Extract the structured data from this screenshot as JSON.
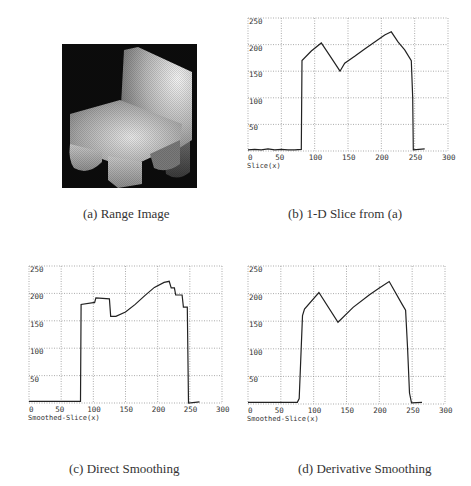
{
  "figure": {
    "panels": [
      {
        "id": "a",
        "caption": "(a) Range Image",
        "type": "image"
      },
      {
        "id": "b",
        "caption": "(b) 1-D Slice from (a)",
        "type": "plot",
        "xlabel": "Slice(x)"
      },
      {
        "id": "c",
        "caption": "(c) Direct Smoothing",
        "type": "plot",
        "xlabel": "Smoothed-Slice(x)"
      },
      {
        "id": "d",
        "caption": "(d) Derivative Smoothing",
        "type": "plot",
        "xlabel": "Smoothed-Slice(x)"
      }
    ]
  },
  "chart_data": [
    {
      "type": "line",
      "title": "(b) 1-D Slice from (a)",
      "xlabel": "Slice(x)",
      "ylabel": "",
      "xlim": [
        0,
        300
      ],
      "ylim": [
        0,
        250
      ],
      "xticks": [
        0,
        50,
        100,
        150,
        200,
        250,
        300
      ],
      "yticks": [
        50,
        100,
        150,
        200,
        250
      ],
      "grid": true,
      "series": [
        {
          "name": "slice",
          "x": [
            0,
            10,
            20,
            30,
            40,
            50,
            60,
            70,
            80,
            81,
            95,
            110,
            125,
            138,
            145,
            160,
            175,
            190,
            205,
            215,
            225,
            235,
            245,
            247,
            248,
            265
          ],
          "y": [
            2,
            3,
            2,
            4,
            2,
            3,
            2,
            2,
            3,
            170,
            188,
            203,
            175,
            150,
            165,
            178,
            192,
            205,
            218,
            224,
            205,
            190,
            170,
            100,
            2,
            4
          ]
        }
      ]
    },
    {
      "type": "line",
      "title": "(c) Direct Smoothing",
      "xlabel": "Smoothed-Slice(x)",
      "ylabel": "",
      "xlim": [
        0,
        300
      ],
      "ylim": [
        0,
        250
      ],
      "xticks": [
        0,
        50,
        100,
        150,
        200,
        250,
        300
      ],
      "yticks": [
        50,
        100,
        150,
        200,
        250
      ],
      "grid": true,
      "series": [
        {
          "name": "direct-smoothed",
          "x": [
            0,
            80,
            81,
            100,
            102,
            104,
            125,
            127,
            135,
            150,
            165,
            180,
            195,
            210,
            218,
            221,
            226,
            228,
            238,
            240,
            246,
            248,
            265
          ],
          "y": [
            3,
            3,
            180,
            183,
            183,
            192,
            190,
            158,
            158,
            166,
            180,
            196,
            211,
            220,
            222,
            210,
            210,
            197,
            197,
            175,
            175,
            0,
            2
          ]
        }
      ]
    },
    {
      "type": "line",
      "title": "(d) Derivative Smoothing",
      "xlabel": "Smoothed-Slice(x)",
      "ylabel": "",
      "xlim": [
        0,
        300
      ],
      "ylim": [
        0,
        250
      ],
      "xticks": [
        0,
        50,
        100,
        150,
        200,
        250,
        300
      ],
      "yticks": [
        50,
        100,
        150,
        200,
        250
      ],
      "grid": true,
      "series": [
        {
          "name": "derivative-smoothed",
          "x": [
            0,
            75,
            78,
            83,
            86,
            108,
            137,
            160,
            185,
            200,
            215,
            235,
            240,
            243,
            246,
            249,
            265
          ],
          "y": [
            3,
            3,
            10,
            160,
            172,
            202,
            148,
            175,
            198,
            210,
            222,
            180,
            170,
            100,
            20,
            2,
            3
          ]
        }
      ]
    }
  ]
}
